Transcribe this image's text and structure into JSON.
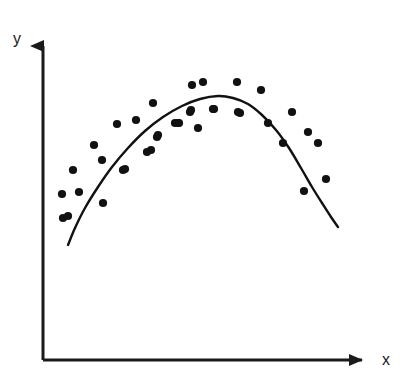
{
  "chart_data": {
    "type": "scatter",
    "title": "",
    "subtitle": "",
    "xlabel": "x",
    "ylabel": "y",
    "xlim": [
      0,
      100
    ],
    "ylim": [
      0,
      100
    ],
    "grid": false,
    "legend": null,
    "annotations": [],
    "series": [
      {
        "name": "data points",
        "type": "scatter",
        "marker": "filled-circle",
        "marker_size_px": 6,
        "color": "#111111",
        "points_px": [
          [
            63,
            218
          ],
          [
            62,
            194
          ],
          [
            73,
            170
          ],
          [
            79,
            192
          ],
          [
            68,
            216
          ],
          [
            94,
            145
          ],
          [
            102,
            160
          ],
          [
            103,
            203
          ],
          [
            117,
            124
          ],
          [
            123,
            170
          ],
          [
            125,
            169
          ],
          [
            136,
            120
          ],
          [
            147,
            152
          ],
          [
            151,
            150
          ],
          [
            153,
            103
          ],
          [
            157,
            137
          ],
          [
            158,
            135
          ],
          [
            175,
            123
          ],
          [
            178,
            123
          ],
          [
            179,
            123
          ],
          [
            190,
            112
          ],
          [
            191,
            110
          ],
          [
            192,
            85
          ],
          [
            198,
            128
          ],
          [
            203,
            82
          ],
          [
            213,
            109
          ],
          [
            214,
            109
          ],
          [
            237,
            82
          ],
          [
            240,
            113
          ],
          [
            238,
            112
          ],
          [
            261,
            90
          ],
          [
            268,
            123
          ],
          [
            283,
            143
          ],
          [
            292,
            112
          ],
          [
            304,
            191
          ],
          [
            308,
            132
          ],
          [
            318,
            143
          ],
          [
            326,
            179
          ]
        ],
        "points_data": [
          [
            7.0,
            42.0
          ],
          [
            6.6,
            49.0
          ],
          [
            10.2,
            56.6
          ],
          [
            12.2,
            49.6
          ],
          [
            8.6,
            42.6
          ],
          [
            17.3,
            58.8
          ],
          [
            20.0,
            54.0
          ],
          [
            20.3,
            40.4
          ],
          [
            24.9,
            66.0
          ],
          [
            26.9,
            52.3
          ],
          [
            27.6,
            52.6
          ],
          [
            31.3,
            67.3
          ],
          [
            35.0,
            57.0
          ],
          [
            36.3,
            57.6
          ],
          [
            37.0,
            72.6
          ],
          [
            38.3,
            61.6
          ],
          [
            38.6,
            62.3
          ],
          [
            44.3,
            66.0
          ],
          [
            45.2,
            66.0
          ],
          [
            45.5,
            66.0
          ],
          [
            49.1,
            69.6
          ],
          [
            49.4,
            70.3
          ],
          [
            49.7,
            78.6
          ],
          [
            51.6,
            64.6
          ],
          [
            55.3,
            79.6
          ],
          [
            58.6,
            70.9
          ],
          [
            58.9,
            70.9
          ],
          [
            66.5,
            79.6
          ],
          [
            67.4,
            69.6
          ],
          [
            66.8,
            70.0
          ],
          [
            74.4,
            76.9
          ],
          [
            76.7,
            67.3
          ],
          [
            81.6,
            60.6
          ],
          [
            84.6,
            70.9
          ],
          [
            91.5,
            54.9
          ],
          [
            92.8,
            64.6
          ],
          [
            96.1,
            60.6
          ],
          [
            98.7,
            48.6
          ]
        ]
      },
      {
        "name": "fitted curve",
        "type": "line",
        "color": "#111111",
        "linewidth_px": 2.4,
        "shape": "concave-parabola",
        "path_px": [
          [
            68,
            245
          ],
          [
            75,
            228
          ],
          [
            85,
            208
          ],
          [
            98,
            187
          ],
          [
            112,
            167
          ],
          [
            128,
            148
          ],
          [
            145,
            131
          ],
          [
            163,
            117
          ],
          [
            182,
            106
          ],
          [
            200,
            99
          ],
          [
            218,
            96
          ],
          [
            233,
            98
          ],
          [
            248,
            104
          ],
          [
            262,
            115
          ],
          [
            276,
            130
          ],
          [
            289,
            148
          ],
          [
            301,
            168
          ],
          [
            312,
            187
          ],
          [
            322,
            203
          ],
          [
            331,
            217
          ],
          [
            338,
            227
          ]
        ],
        "vertex_px": [
          222,
          96
        ],
        "start_px": [
          68,
          245
        ],
        "end_px": [
          338,
          227
        ]
      }
    ],
    "axes": {
      "origin_px": [
        43,
        360
      ],
      "y_axis_top_px": [
        43,
        34
      ],
      "x_axis_right_px": [
        375,
        360
      ],
      "arrowheads": [
        "y-axis-up",
        "x-axis-right"
      ],
      "line_color": "#1a1a1a",
      "line_width_px": 3,
      "ticks": [],
      "tick_labels": []
    }
  },
  "figure": {
    "background_color": "#ffffff",
    "foreground_color": "#111111",
    "y_axis_label": "y",
    "x_axis_label": "x"
  }
}
